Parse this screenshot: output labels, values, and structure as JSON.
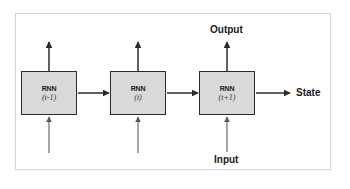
{
  "diagram": {
    "type": "unrolled-rnn",
    "cells": [
      {
        "title": "RNN",
        "step": "(t-1)"
      },
      {
        "title": "RNN",
        "step": "(t)"
      },
      {
        "title": "RNN",
        "step": "(t+1)"
      }
    ],
    "labels": {
      "output": "Output",
      "input": "Input",
      "state": "State"
    },
    "colors": {
      "cell_fill": "#d9d9d9",
      "cell_border": "#2b2b2b",
      "arrow_dark": "#2b2b2b",
      "arrow_input": "#6e6e6e",
      "frame_border": "#d6d6d6"
    }
  }
}
